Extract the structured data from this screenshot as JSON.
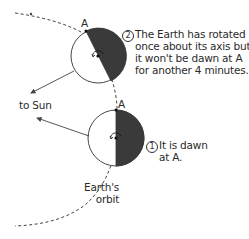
{
  "diagram": {
    "colors": {
      "night": "#3a3a3a",
      "day": "#ffffff",
      "outline": "#333333",
      "orbit": "#444444",
      "text": "#2b2b2b"
    },
    "labels": {
      "point_a_upper": "A",
      "point_a_lower": "A",
      "to_sun": "to Sun",
      "orbit_line1": "Earth's",
      "orbit_line2": "orbit"
    },
    "steps": [
      {
        "number": "1",
        "lines": [
          "It is dawn",
          "at A."
        ]
      },
      {
        "number": "2",
        "lines": [
          "The Earth has rotated",
          "once about its axis but",
          "it won't be dawn at A",
          "for another 4 minutes."
        ]
      }
    ],
    "earths": [
      {
        "id": "earth-position-1",
        "cx": 116,
        "cy": 138,
        "r": 28,
        "a_x": 116,
        "a_y": 110
      },
      {
        "id": "earth-position-2",
        "cx": 98,
        "cy": 56,
        "r": 27,
        "a_x": 86,
        "a_y": 31
      }
    ]
  }
}
